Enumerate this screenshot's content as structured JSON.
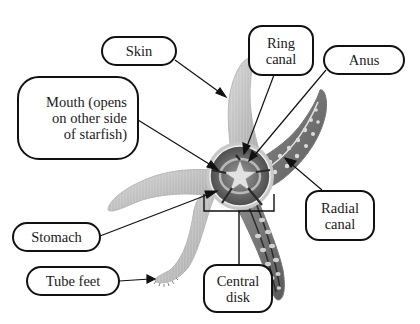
{
  "diagram": {
    "labels": {
      "skin": "Skin",
      "mouth": "Mouth (opens\non other side\nof starfish)",
      "ring_canal": "Ring\ncanal",
      "anus": "Anus",
      "radial_canal": "Radial\ncanal",
      "stomach": "Stomach",
      "tube_feet": "Tube feet",
      "central_disk": "Central\ndisk"
    },
    "colors": {
      "outline": "#111111",
      "skin_light": "#c9c9c9",
      "skin_dark": "#8a8a8a",
      "cutaway_dark": "#4a4a4a",
      "background": "#ffffff"
    }
  }
}
